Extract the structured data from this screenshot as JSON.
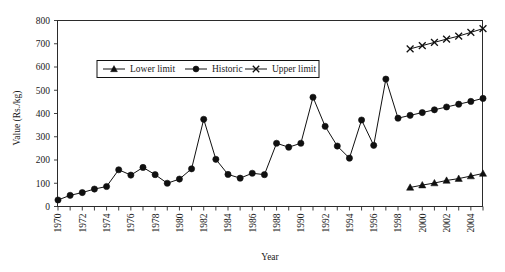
{
  "chart_data": {
    "type": "line",
    "title": "",
    "subtitle": "",
    "xlabel": "Year",
    "ylabel": "Value (Rs./kg)",
    "xlim": [
      1970,
      2005
    ],
    "ylim": [
      0,
      800
    ],
    "ytick_step": 100,
    "yticks": [
      0,
      100,
      200,
      300,
      400,
      500,
      600,
      700,
      800
    ],
    "ytick_labels": [
      "0",
      "100",
      "200",
      "300",
      "400",
      "500",
      "600",
      "700",
      "800"
    ],
    "xticks": [
      1970,
      1971,
      1972,
      1973,
      1974,
      1975,
      1976,
      1977,
      1978,
      1979,
      1980,
      1981,
      1982,
      1983,
      1984,
      1985,
      1986,
      1987,
      1988,
      1989,
      1990,
      1991,
      1992,
      1993,
      1994,
      1995,
      1996,
      1997,
      1998,
      1999,
      2000,
      2001,
      2002,
      2003,
      2004,
      2005
    ],
    "xtick_labels": [
      "1970",
      "",
      "1972",
      "",
      "1974",
      "",
      "1976",
      "",
      "1978",
      "",
      "1980",
      "",
      "1982",
      "",
      "1984",
      "",
      "1986",
      "",
      "1988",
      "",
      "1990",
      "",
      "1992",
      "",
      "1994",
      "",
      "1996",
      "",
      "1998",
      "",
      "2000",
      "",
      "2002",
      "",
      "2004",
      ""
    ],
    "xtick_label_rotation": -90,
    "grid": false,
    "legend_position": "upper-left-inside",
    "series": [
      {
        "name": "Lower limit",
        "marker": "triangle",
        "color": "#101010",
        "x": [
          1999,
          2000,
          2001,
          2002,
          2003,
          2004,
          2005
        ],
        "values": [
          82,
          92,
          101,
          112,
          120,
          131,
          142
        ]
      },
      {
        "name": "Historic",
        "marker": "circle",
        "color": "#101010",
        "x": [
          1970,
          1971,
          1972,
          1973,
          1974,
          1975,
          1976,
          1977,
          1978,
          1979,
          1980,
          1981,
          1982,
          1983,
          1984,
          1985,
          1986,
          1987,
          1988,
          1989,
          1990,
          1991,
          1992,
          1993,
          1994,
          1995,
          1996,
          1997,
          1998,
          1999,
          2000,
          2001,
          2002,
          2003,
          2004,
          2005
        ],
        "values": [
          28,
          48,
          60,
          75,
          86,
          158,
          135,
          168,
          137,
          100,
          118,
          162,
          375,
          203,
          138,
          122,
          143,
          137,
          272,
          255,
          272,
          470,
          345,
          260,
          208,
          372,
          263,
          548,
          380,
          392,
          404,
          416,
          428,
          440,
          452,
          465
        ]
      },
      {
        "name": "Upper limit",
        "marker": "cross",
        "color": "#101010",
        "x": [
          1999,
          2000,
          2001,
          2002,
          2003,
          2004,
          2005
        ],
        "values": [
          678,
          692,
          706,
          720,
          733,
          749,
          765
        ]
      }
    ],
    "legend_entries": [
      {
        "label": "Lower limit",
        "marker": "triangle"
      },
      {
        "label": "Historic",
        "marker": "circle"
      },
      {
        "label": "Upper limit",
        "marker": "cross"
      }
    ]
  }
}
